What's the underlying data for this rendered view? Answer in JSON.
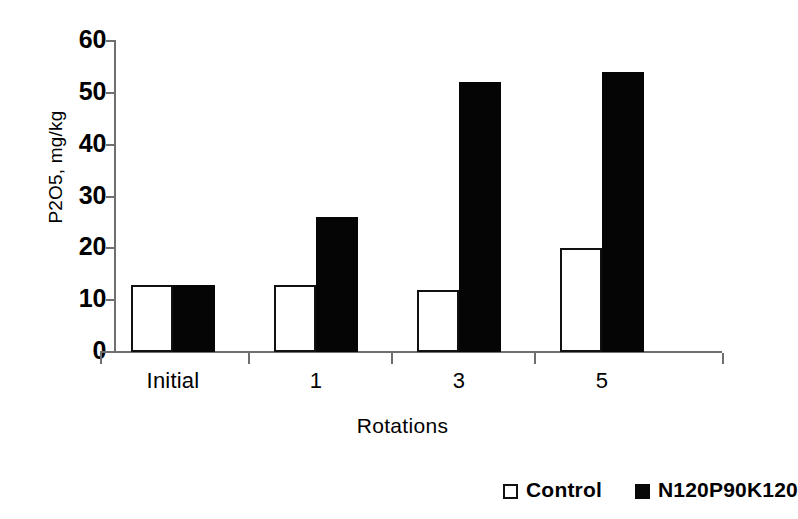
{
  "chart_data": {
    "type": "bar",
    "title": "",
    "xlabel": "Rotations",
    "ylabel": "P2O5, mg/kg",
    "categories": [
      "Initial",
      "1",
      "3",
      "5"
    ],
    "series": [
      {
        "name": "Control",
        "values": [
          13,
          13,
          12,
          20
        ]
      },
      {
        "name": "N120P90K120",
        "values": [
          13,
          26,
          52,
          54
        ]
      }
    ],
    "ylim": [
      0,
      60
    ],
    "ytick_labels": [
      "0",
      "10",
      "20",
      "30",
      "40",
      "50",
      "60"
    ],
    "ytick_values": [
      0,
      10,
      20,
      30,
      40,
      50,
      60
    ],
    "grid": false,
    "legend_position": "bottom-right",
    "colors": {
      "control_fill": "#ffffff",
      "control_stroke": "#111111",
      "treatment_fill": "#050505",
      "axis": "#6f6f6f",
      "text": "#000000",
      "background": "#ffffff"
    }
  },
  "legend": {
    "items": [
      {
        "label": "Control",
        "marker": "open-square-marker"
      },
      {
        "label": "N120P90K120",
        "marker": "filled-square-marker"
      }
    ]
  }
}
